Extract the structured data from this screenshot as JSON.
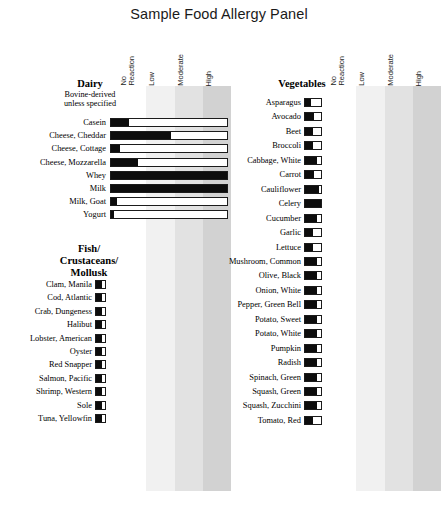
{
  "title": "Sample Food Allergy Panel",
  "scale": {
    "headers": [
      "No\nReaction",
      "Low",
      "Moderate",
      "High"
    ],
    "band_colors": [
      "#ffffff",
      "#f1f1f1",
      "#e2e2e2",
      "#d2d2d2"
    ]
  },
  "chart_data": {
    "type": "bar",
    "title": "Sample Food Allergy Panel",
    "xlabel": "",
    "ylabel": "",
    "orientation": "horizontal",
    "scale_labels": [
      "No Reaction",
      "Low",
      "Moderate",
      "High"
    ],
    "value_range": [
      0,
      4
    ],
    "grid": false,
    "legend": "none",
    "note": "Each row is a food allergen; bar fill length indicates reaction severity across the four-zone scale (No Reaction, Low, Moderate, High).",
    "groups": [
      {
        "name": "Dairy",
        "subtitle": "Bovine-derived unless specified",
        "panel": "left",
        "categories": [
          "Casein",
          "Cheese, Cheddar",
          "Cheese, Cottage",
          "Cheese, Mozzarella",
          "Whey",
          "Milk",
          "Milk, Goat",
          "Yogurt"
        ],
        "values": [
          0.62,
          2.08,
          0.32,
          0.94,
          4.0,
          4.0,
          0.22,
          0.1
        ]
      },
      {
        "name": "Fish/ Crustaceans/ Mollusk",
        "panel": "left",
        "categories": [
          "Clam, Manila",
          "Cod, Atlantic",
          "Crab, Dungeness",
          "Halibut",
          "Lobster, American",
          "Oyster",
          "Red Snapper",
          "Salmon, Pacific",
          "Shrimp, Western",
          "Sole",
          "Tuna, Yellowfin"
        ],
        "values": [
          0.26,
          0.26,
          0.26,
          0.26,
          0.26,
          0.26,
          0.26,
          0.26,
          0.26,
          0.26,
          0.26
        ]
      },
      {
        "name": "Vegetables",
        "panel": "right",
        "categories": [
          "Asparagus",
          "Avocado",
          "Beet",
          "Broccoli",
          "Cabbage, White",
          "Carrot",
          "Cauliflower",
          "Celery",
          "Cucumber",
          "Garlic",
          "Lettuce",
          "Mushroom, Common",
          "Olive, Black",
          "Onion, White",
          "Pepper, Green Bell",
          "Potato, Sweet",
          "Potato, White",
          "Pumpkin",
          "Radish",
          "Spinach, Green",
          "Squash, Green",
          "Squash, Zucchini",
          "Tomato, Red"
        ],
        "values": [
          0.28,
          0.26,
          0.24,
          0.27,
          0.2,
          0.3,
          0.42,
          0.46,
          0.2,
          0.3,
          0.3,
          0.19,
          0.2,
          0.2,
          0.2,
          0.2,
          0.2,
          0.2,
          0.2,
          0.2,
          0.2,
          0.2,
          0.3
        ]
      }
    ]
  },
  "left_panel": {
    "dairy": {
      "heading": "Dairy",
      "subtitle_line1": "Bovine-derived",
      "subtitle_line2": "unless specified",
      "rows": [
        {
          "label": "Casein",
          "fill": 0.155
        },
        {
          "label": "Cheese, Cheddar",
          "fill": 0.52
        },
        {
          "label": "Cheese, Cottage",
          "fill": 0.08
        },
        {
          "label": "Cheese, Mozzarella",
          "fill": 0.235
        },
        {
          "label": "Whey",
          "fill": 1.0
        },
        {
          "label": "Milk",
          "fill": 1.0
        },
        {
          "label": "Milk, Goat",
          "fill": 0.055
        },
        {
          "label": "Yogurt",
          "fill": 0.025
        }
      ]
    },
    "fish": {
      "heading_line1": "Fish/",
      "heading_line2": "Crustaceans/",
      "heading_line3": "Mollusk",
      "rows": [
        {
          "label": "Clam, Manila",
          "fill": 0.65
        },
        {
          "label": "Cod, Atlantic",
          "fill": 0.65
        },
        {
          "label": "Crab, Dungeness",
          "fill": 0.65
        },
        {
          "label": "Halibut",
          "fill": 0.65
        },
        {
          "label": "Lobster, American",
          "fill": 0.65
        },
        {
          "label": "Oyster",
          "fill": 0.65
        },
        {
          "label": "Red Snapper",
          "fill": 0.65
        },
        {
          "label": "Salmon, Pacific",
          "fill": 0.65
        },
        {
          "label": "Shrimp, Western",
          "fill": 0.65
        },
        {
          "label": "Sole",
          "fill": 0.65
        },
        {
          "label": "Tuna, Yellowfin",
          "fill": 0.65
        }
      ]
    }
  },
  "right_panel": {
    "vegetables": {
      "heading": "Vegetables",
      "rows": [
        {
          "label": "Asparagus",
          "fill": 0.36
        },
        {
          "label": "Avocado",
          "fill": 0.55
        },
        {
          "label": "Beet",
          "fill": 0.5
        },
        {
          "label": "Broccoli",
          "fill": 0.5
        },
        {
          "label": "Cabbage, White",
          "fill": 0.72
        },
        {
          "label": "Carrot",
          "fill": 0.55
        },
        {
          "label": "Cauliflower",
          "fill": 0.88
        },
        {
          "label": "Celery",
          "fill": 1.0
        },
        {
          "label": "Cucumber",
          "fill": 0.72
        },
        {
          "label": "Garlic",
          "fill": 0.5
        },
        {
          "label": "Lettuce",
          "fill": 0.5
        },
        {
          "label": "Mushroom, Common",
          "fill": 0.72
        },
        {
          "label": "Olive, Black",
          "fill": 0.72
        },
        {
          "label": "Onion, White",
          "fill": 0.72
        },
        {
          "label": "Pepper, Green Bell",
          "fill": 0.72
        },
        {
          "label": "Potato, Sweet",
          "fill": 0.72
        },
        {
          "label": "Potato, White",
          "fill": 0.72
        },
        {
          "label": "Pumpkin",
          "fill": 0.72
        },
        {
          "label": "Radish",
          "fill": 0.72
        },
        {
          "label": "Spinach, Green",
          "fill": 0.72
        },
        {
          "label": "Squash, Green",
          "fill": 0.72
        },
        {
          "label": "Squash, Zucchini",
          "fill": 0.72
        },
        {
          "label": "Tomato, Red",
          "fill": 0.5
        }
      ]
    }
  }
}
